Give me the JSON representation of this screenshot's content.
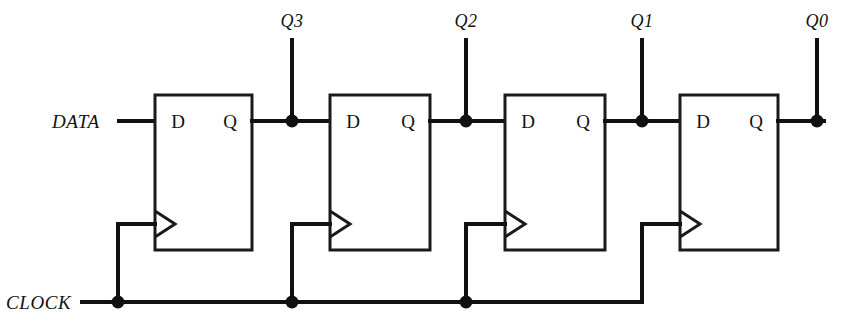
{
  "diagram": {
    "line_color": "#111111",
    "background": "#ffffff"
  },
  "signals": {
    "data_label": "DATA",
    "clock_label": "CLOCK"
  },
  "flipflops": [
    {
      "id": "ff1",
      "d_label": "D",
      "q_label": "Q",
      "output_label": "Q3"
    },
    {
      "id": "ff2",
      "d_label": "D",
      "q_label": "Q",
      "output_label": "Q2"
    },
    {
      "id": "ff3",
      "d_label": "D",
      "q_label": "Q",
      "output_label": "Q1"
    },
    {
      "id": "ff4",
      "d_label": "D",
      "q_label": "Q",
      "output_label": "Q0"
    }
  ],
  "outputs": [
    "Q3",
    "Q2",
    "Q1",
    "Q0"
  ]
}
